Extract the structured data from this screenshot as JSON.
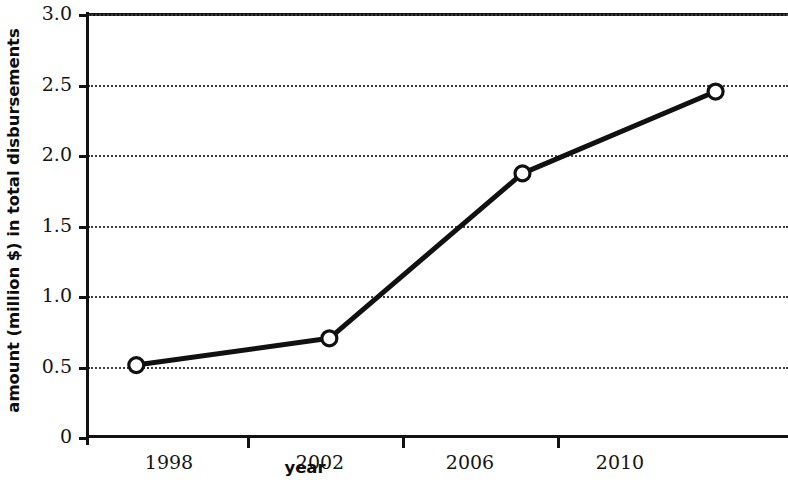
{
  "chart_data": {
    "type": "line",
    "title": "",
    "xlabel": "year",
    "ylabel": "amount (million $) in total disbursements",
    "x": [
      1998,
      2002,
      2006,
      2010
    ],
    "values": [
      0.51,
      0.7,
      1.87,
      2.45
    ],
    "categories": [
      "1998",
      "2002",
      "2006",
      "2010"
    ],
    "xlim": [
      1997,
      2011.5
    ],
    "ylim": [
      0,
      3.0
    ],
    "ytick_labels": [
      "0",
      "0.5",
      "1.0",
      "1.5",
      "2.0",
      "2.5",
      "3.0"
    ],
    "ytick_values": [
      0,
      0.5,
      1.0,
      1.5,
      2.0,
      2.5,
      3.0
    ],
    "xtick_labels": [
      "1998",
      "2002",
      "2006",
      "2010"
    ],
    "xtick_values": [
      1998,
      2002,
      2006,
      2010
    ],
    "xminor_tick_values": [
      2000,
      2004,
      2008
    ],
    "grid": "horizontal-dotted",
    "legend": "none",
    "line_color": "#111111",
    "marker": "open-circle",
    "marker_face_color": "#ffffff",
    "background_color": "#ffffff"
  },
  "axis": {
    "y_title": "amount (million $) in total disbursements",
    "x_title": "year"
  }
}
